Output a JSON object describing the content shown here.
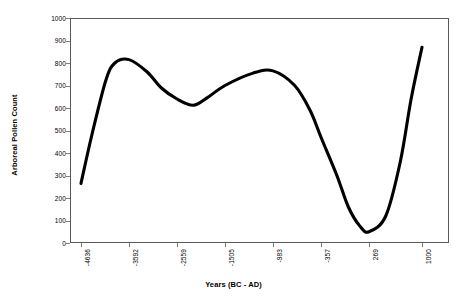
{
  "chart_data": {
    "type": "line",
    "title": "",
    "xlabel": "Years (BC - AD)",
    "ylabel": "Arboreal Pollen Count",
    "xlim": [
      -4636,
      1000
    ],
    "ylim": [
      0,
      1000
    ],
    "grid": false,
    "legend": "none",
    "line_color": "#000000",
    "frame_color": "#595959",
    "x_tick_labels": [
      "-4636",
      "-3592",
      "-2559",
      "-1505",
      "-983",
      "-357",
      "269",
      "1000"
    ],
    "x_tick_values": [
      -4636,
      -3592,
      -2559,
      -1505,
      -983,
      -357,
      269,
      1000
    ],
    "y_tick_labels": [
      "0",
      "100",
      "200",
      "300",
      "400",
      "500",
      "600",
      "700",
      "800",
      "900",
      "1000"
    ],
    "y_tick_values": [
      0,
      100,
      200,
      300,
      400,
      500,
      600,
      700,
      800,
      900,
      1000
    ],
    "series": [
      {
        "name": "Arboreal Pollen Count",
        "x": [
          -4636,
          -4400,
          -4100,
          -3900,
          -3592,
          -3200,
          -2900,
          -2559,
          -2200,
          -1900,
          -1505,
          -1200,
          -983,
          -700,
          -500,
          -357,
          -150,
          0,
          150,
          269,
          500,
          700,
          850,
          1000
        ],
        "values": [
          265,
          480,
          720,
          800,
          815,
          760,
          690,
          640,
          612,
          645,
          700,
          755,
          765,
          700,
          590,
          470,
          300,
          160,
          75,
          50,
          120,
          360,
          640,
          870
        ]
      }
    ],
    "annotations": {
      "start_point": {
        "x": -4636,
        "y": 265
      },
      "first_peak": {
        "x": -3700,
        "y": 815
      },
      "local_minimum": {
        "x": -2360,
        "y": 610
      },
      "second_peak": {
        "x": -1100,
        "y": 765
      },
      "global_minimum": {
        "x": 160,
        "y": 48
      },
      "end_point": {
        "x": 1000,
        "y": 870
      }
    }
  }
}
